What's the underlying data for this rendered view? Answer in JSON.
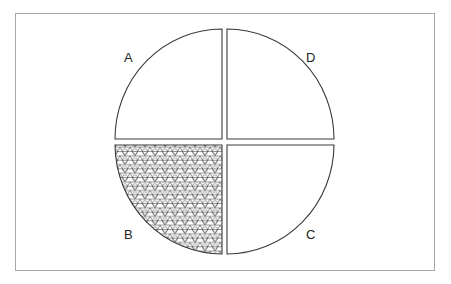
{
  "diagram": {
    "type": "quartered-circle",
    "colors": {
      "frame": "#a8a8a8",
      "outline": "#3a3a3a",
      "fill": "#ffffff",
      "pattern": "#3a3a3a"
    },
    "quadrants": [
      {
        "id": "A",
        "label": "A",
        "position": "top-left",
        "shaded": false
      },
      {
        "id": "D",
        "label": "D",
        "position": "top-right",
        "shaded": false
      },
      {
        "id": "B",
        "label": "B",
        "position": "bottom-left",
        "shaded": true
      },
      {
        "id": "C",
        "label": "C",
        "position": "bottom-right",
        "shaded": false
      }
    ]
  }
}
